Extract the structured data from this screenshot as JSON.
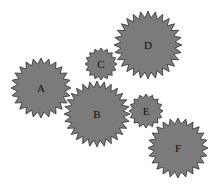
{
  "diagram": {
    "type": "gear-train",
    "colors": {
      "fill": "#7b7b7b",
      "stroke": "#2e2e2e",
      "label": "#111111",
      "background": "#ffffff"
    },
    "gears": [
      {
        "label": "A",
        "cx": 41,
        "cy": 88,
        "r": 30,
        "teeth": 24
      },
      {
        "label": "B",
        "cx": 97,
        "cy": 114,
        "r": 33,
        "teeth": 28
      },
      {
        "label": "C",
        "cx": 101,
        "cy": 64,
        "r": 16,
        "teeth": 16
      },
      {
        "label": "D",
        "cx": 148,
        "cy": 45,
        "r": 34,
        "teeth": 28
      },
      {
        "label": "E",
        "cx": 146,
        "cy": 111,
        "r": 17,
        "teeth": 16
      },
      {
        "label": "F",
        "cx": 178,
        "cy": 148,
        "r": 30,
        "teeth": 24
      }
    ]
  }
}
